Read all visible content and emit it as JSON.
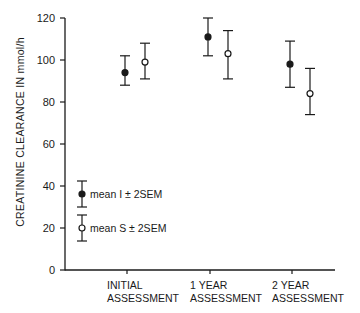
{
  "chart_data": {
    "type": "scatter",
    "subtype": "errorbar",
    "title": "",
    "xlabel": "",
    "ylabel": "CREATININE CLEARANCE IN mmol/h",
    "ylim": [
      0,
      120
    ],
    "yticks": [
      0,
      20,
      40,
      60,
      80,
      100,
      120
    ],
    "grid": false,
    "categories": [
      [
        "INITIAL",
        "ASSESSMENT"
      ],
      [
        "1 YEAR",
        "ASSESSMENT"
      ],
      [
        "2 YEAR",
        "ASSESSMENT"
      ]
    ],
    "series": [
      {
        "name": "mean I ± 2SEM",
        "marker": "filled-circle",
        "values": [
          94,
          111,
          98
        ],
        "upper": [
          102,
          120,
          109
        ],
        "lower": [
          88,
          102,
          87
        ]
      },
      {
        "name": "mean S ± 2SEM",
        "marker": "open-circle",
        "values": [
          99,
          103,
          84
        ],
        "upper": [
          108,
          114,
          96
        ],
        "lower": [
          91,
          91,
          74
        ]
      }
    ],
    "legend": {
      "position": "inside-lower-left",
      "entries": [
        {
          "label": "mean I ± 2SEM",
          "marker": "filled-circle"
        },
        {
          "label": "mean S ± 2SEM",
          "marker": "open-circle"
        }
      ]
    },
    "colors": {
      "ink": "#1a1a1a",
      "background": "#ffffff"
    }
  }
}
